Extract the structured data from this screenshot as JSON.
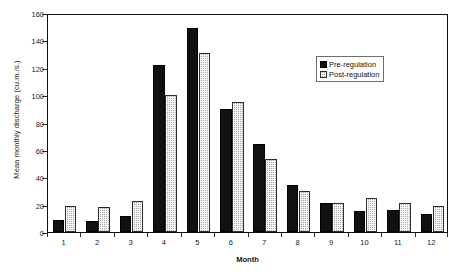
{
  "chart_data": {
    "type": "bar",
    "title": "",
    "subtitle": "",
    "xlabel": "Month",
    "ylabel": "Mean monthly discharge (cu.m./s.)",
    "categories": [
      "1",
      "2",
      "3",
      "4",
      "5",
      "6",
      "7",
      "8",
      "9",
      "10",
      "11",
      "12"
    ],
    "series": [
      {
        "name": "Pre-regulation",
        "values": [
          9,
          8,
          12,
          122,
          149,
          90,
          64,
          34,
          21,
          15,
          16,
          13
        ],
        "color": "#111111",
        "fill": "solid-black"
      },
      {
        "name": "Post-regulation",
        "values": [
          19,
          18,
          23,
          100,
          131,
          95,
          53,
          30,
          21,
          25,
          21,
          19
        ],
        "color": "#a9a9a9",
        "fill": "checkered-gray"
      }
    ],
    "ylim": [
      0,
      160
    ],
    "yticks": [
      0,
      20,
      40,
      60,
      80,
      100,
      120,
      140,
      160
    ],
    "ytick_labels": [
      "0",
      "20",
      "40",
      "60",
      "80",
      "100",
      "120",
      "140",
      "160"
    ],
    "grid": false,
    "legend_position": "upper-right-inside",
    "legend_entries": [
      "Pre-regulation",
      "Post-regulation"
    ]
  },
  "axes": {
    "y_title": "Mean monthly discharge (cu.m./s.)",
    "x_title": "Month"
  },
  "legend": {
    "items": [
      {
        "label": "Pre-regulation"
      },
      {
        "label": "Post-regulation"
      }
    ]
  }
}
